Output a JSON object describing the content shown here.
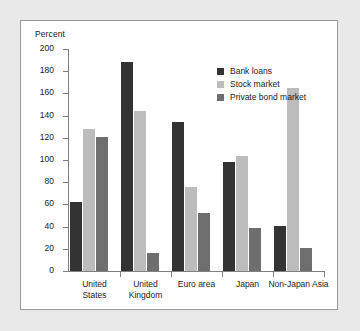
{
  "chart_data": {
    "type": "bar",
    "title": "",
    "subtitle": "",
    "xlabel": "",
    "ylabel": "Percent",
    "ylim": [
      0,
      200
    ],
    "ytick_labels": [
      "200",
      "180",
      "160",
      "140",
      "120",
      "100",
      "80",
      "60",
      "40",
      "20",
      "0"
    ],
    "ytick_values": [
      200,
      180,
      160,
      140,
      120,
      100,
      80,
      60,
      40,
      20,
      0
    ],
    "grid": false,
    "legend_position": "top-right",
    "categories": [
      "United\nStates",
      "United\nKingdom",
      "Euro area",
      "Japan",
      "Non-Japan Asia"
    ],
    "series": [
      {
        "name": "Bank loans",
        "color": "#333333",
        "values": [
          62,
          188,
          134,
          98,
          41
        ]
      },
      {
        "name": "Stock market",
        "color": "#bcbcbc",
        "values": [
          128,
          144,
          76,
          104,
          165
        ]
      },
      {
        "name": "Private bond market",
        "color": "#6e6e6e",
        "values": [
          121,
          16,
          52,
          39,
          21
        ]
      }
    ]
  },
  "legend": {
    "items": [
      {
        "label": "Bank loans",
        "color": "#333333"
      },
      {
        "label": "Stock market",
        "color": "#bcbcbc"
      },
      {
        "label": "Private bond market",
        "color": "#6e6e6e"
      }
    ]
  },
  "colors": {
    "page_background": "#e9e9e9",
    "panel_background": "#ffffff",
    "panel_border": "#9a9a9a",
    "axis": "#808080",
    "text": "#1a1a1a"
  }
}
